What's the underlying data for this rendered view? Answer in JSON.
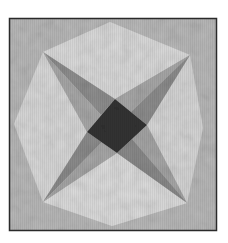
{
  "image": {
    "subject": "quilt block",
    "description": "Grayscale quilt block with a dark center diamond, four dark-gray star arms radiating to the corners, and light mottled kite panels forming an octagon on a medium-gray square background",
    "frame": {
      "x": 9,
      "y": 18,
      "width": 208,
      "height": 213,
      "stroke": "#2a2a2a"
    },
    "colors": {
      "page_bg": "#ffffff",
      "block_bg": "#b9b9b9",
      "light_panel": "#dcdcdc",
      "arm_dark": "#8a8a8a",
      "arm_light": "#a5a5a5",
      "center": "#333333"
    },
    "geometry": {
      "center_diamond": [
        [
          115,
          99
        ],
        [
          147,
          125
        ],
        [
          117,
          153
        ],
        [
          87,
          132
        ]
      ],
      "arm_tips": {
        "top_left": [
          43,
          52
        ],
        "top_right": [
          190,
          55
        ],
        "bottom_right": [
          187,
          203
        ],
        "bottom_left": [
          43,
          202
        ]
      },
      "panel_peaks": {
        "top": [
          110,
          22
        ],
        "right": [
          203,
          128
        ],
        "bottom": [
          112,
          226
        ],
        "left": [
          14,
          124
        ]
      }
    }
  }
}
